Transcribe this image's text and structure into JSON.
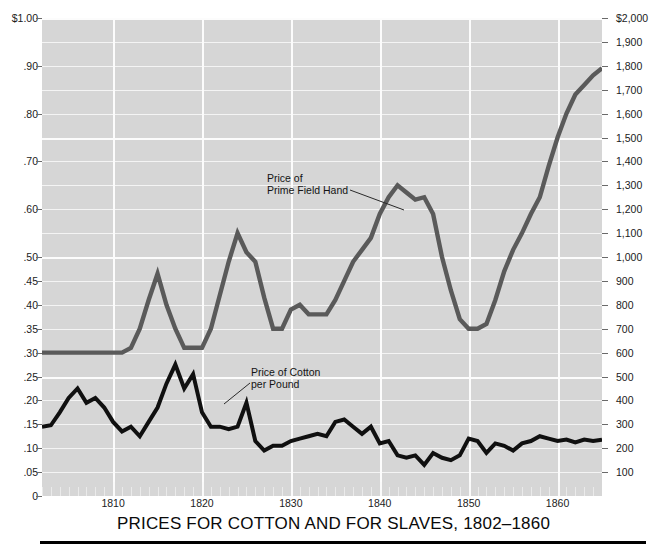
{
  "chart_data": {
    "type": "line",
    "title": "PRICES FOR COTTON AND FOR SLAVES, 1802–1860",
    "xlabel": "",
    "ylabel_left": "",
    "ylabel_right": "",
    "xlim": [
      1802,
      1865
    ],
    "grid": true,
    "legend": "annotations-on-plot",
    "background_color": "#d6d6d6",
    "gridline_color": "#fcfcfc",
    "x_tick_labels": [
      "1810",
      "1820",
      "1830",
      "1840",
      "1850",
      "1860"
    ],
    "x_tick_values": [
      1810,
      1820,
      1830,
      1840,
      1850,
      1860
    ],
    "x_minor_tick_interval": 1,
    "y_left_axis": {
      "label_top": "$1.00",
      "ticks": [
        "$1.00",
        ".90",
        ".80",
        ".70",
        ".60",
        ".50",
        ".45",
        ".40",
        ".35",
        ".30",
        ".25",
        ".20",
        ".15",
        ".10",
        ".05",
        "0"
      ],
      "values": [
        1.0,
        0.9,
        0.8,
        0.7,
        0.6,
        0.5,
        0.45,
        0.4,
        0.35,
        0.3,
        0.25,
        0.2,
        0.15,
        0.1,
        0.05,
        0
      ],
      "note": "scale expands below .50 — .50 to 0 occupies the same height as $1.00 to .50",
      "range": [
        0,
        1.0
      ]
    },
    "y_right_axis": {
      "label_top": "$2,000",
      "ticks": [
        "$2,000",
        "1,900",
        "1,800",
        "1,700",
        "1,600",
        "1,500",
        "1,400",
        "1,300",
        "1,200",
        "1,100",
        "1,000",
        "900",
        "800",
        "700",
        "600",
        "500",
        "400",
        "300",
        "200",
        "100"
      ],
      "values": [
        2000,
        1900,
        1800,
        1700,
        1600,
        1500,
        1400,
        1300,
        1200,
        1100,
        1000,
        900,
        800,
        700,
        600,
        500,
        400,
        300,
        200,
        100
      ],
      "range": [
        0,
        2000
      ]
    },
    "annotations": [
      {
        "name": "slave-price-label",
        "text": "Price of\nPrime Field Hand",
        "x": 267,
        "y": 172
      },
      {
        "name": "cotton-price-label",
        "text": "Price of Cotton\nper Pound",
        "x": 251,
        "y": 366
      }
    ],
    "series": [
      {
        "name": "Price of Prime Field Hand",
        "axis": "right",
        "unit": "dollars",
        "color": "#5a5a5a",
        "stroke_width": 4.4,
        "x": [
          1802,
          1803,
          1804,
          1805,
          1806,
          1807,
          1808,
          1809,
          1810,
          1811,
          1812,
          1813,
          1814,
          1815,
          1816,
          1817,
          1818,
          1819,
          1820,
          1821,
          1822,
          1823,
          1824,
          1825,
          1826,
          1827,
          1828,
          1829,
          1830,
          1831,
          1832,
          1833,
          1834,
          1835,
          1836,
          1837,
          1838,
          1839,
          1840,
          1841,
          1842,
          1843,
          1844,
          1845,
          1846,
          1847,
          1848,
          1849,
          1850,
          1851,
          1852,
          1853,
          1854,
          1855,
          1856,
          1857,
          1858,
          1859,
          1860,
          1861,
          1862,
          1863,
          1864,
          1865
        ],
        "values": [
          600,
          600,
          600,
          600,
          600,
          600,
          600,
          600,
          600,
          600,
          620,
          700,
          820,
          930,
          800,
          700,
          620,
          620,
          620,
          700,
          840,
          980,
          1100,
          1020,
          980,
          830,
          700,
          700,
          780,
          800,
          760,
          760,
          760,
          820,
          900,
          980,
          1030,
          1080,
          1180,
          1250,
          1300,
          1270,
          1240,
          1250,
          1180,
          1000,
          860,
          740,
          700,
          700,
          720,
          820,
          940,
          1030,
          1100,
          1180,
          1250,
          1380,
          1500,
          1600,
          1680,
          1720,
          1760,
          1790
        ]
      },
      {
        "name": "Price of Cotton per Pound",
        "axis": "left",
        "unit": "dollars_per_pound",
        "color": "#101010",
        "stroke_width": 4.0,
        "x": [
          1802,
          1803,
          1804,
          1805,
          1806,
          1807,
          1808,
          1809,
          1810,
          1811,
          1812,
          1813,
          1814,
          1815,
          1816,
          1817,
          1818,
          1819,
          1820,
          1821,
          1822,
          1823,
          1824,
          1825,
          1826,
          1827,
          1828,
          1829,
          1830,
          1831,
          1832,
          1833,
          1834,
          1835,
          1836,
          1837,
          1838,
          1839,
          1840,
          1841,
          1842,
          1843,
          1844,
          1845,
          1846,
          1847,
          1848,
          1849,
          1850,
          1851,
          1852,
          1853,
          1854,
          1855,
          1856,
          1857,
          1858,
          1859,
          1860,
          1861,
          1862,
          1863,
          1864,
          1865
        ],
        "values": [
          0.145,
          0.148,
          0.175,
          0.205,
          0.225,
          0.195,
          0.205,
          0.185,
          0.155,
          0.135,
          0.145,
          0.125,
          0.155,
          0.185,
          0.235,
          0.275,
          0.225,
          0.255,
          0.175,
          0.145,
          0.145,
          0.14,
          0.145,
          0.195,
          0.115,
          0.095,
          0.105,
          0.105,
          0.115,
          0.12,
          0.125,
          0.13,
          0.125,
          0.155,
          0.16,
          0.145,
          0.13,
          0.145,
          0.11,
          0.115,
          0.085,
          0.08,
          0.085,
          0.065,
          0.09,
          0.08,
          0.075,
          0.085,
          0.12,
          0.115,
          0.09,
          0.11,
          0.105,
          0.095,
          0.11,
          0.115,
          0.125,
          0.12,
          0.115,
          0.118,
          0.112,
          0.118,
          0.115,
          0.118
        ]
      }
    ]
  }
}
